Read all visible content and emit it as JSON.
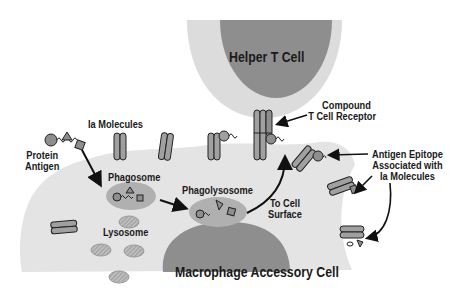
{
  "diagram": {
    "colors": {
      "cell_light": "#e4e4e4",
      "cell_dark": "#8e8e8e",
      "helper_outer": "#dcdcdc",
      "vesicle": "#b0b0b0",
      "molecule": "#a0a0a0",
      "stroke": "#222222"
    },
    "labels": {
      "helper_t_cell": "Helper T Cell",
      "macrophage": "Macrophage Accessory Cell",
      "ia_molecules": "Ia Molecules",
      "compound_receptor_line1": "Compound",
      "compound_receptor_line2": "T Cell Receptor",
      "protein_antigen_line1": "Protein",
      "protein_antigen_line2": "Antigen",
      "phagosome": "Phagosome",
      "phagolysosome": "Phagolysosome",
      "lysosome": "Lysosome",
      "to_cell_surface_line1": "To Cell",
      "to_cell_surface_line2": "Surface",
      "epitope_line1": "Antigen Epitope",
      "epitope_line2": "Associated with",
      "epitope_line3": "Ia Molecules"
    }
  }
}
